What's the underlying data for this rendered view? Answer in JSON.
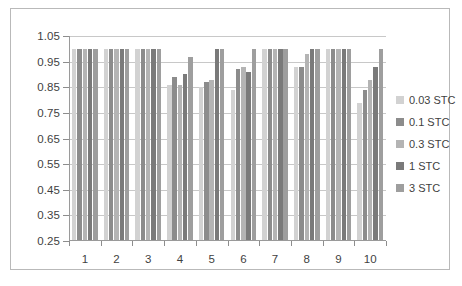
{
  "chart_data": {
    "type": "bar",
    "title": "",
    "xlabel": "",
    "ylabel": "",
    "ylim": [
      0.25,
      1.05
    ],
    "ytick_step": 0.1,
    "ytick_labels": [
      "1.05",
      "0.95",
      "0.85",
      "0.75",
      "0.65",
      "0.55",
      "0.45",
      "0.35",
      "0.25"
    ],
    "ytick_values": [
      1.05,
      0.95,
      0.85,
      0.75,
      0.65,
      0.55,
      0.45,
      0.35,
      0.25
    ],
    "grid": true,
    "legend_position": "right",
    "categories": [
      "1",
      "2",
      "3",
      "4",
      "5",
      "6",
      "7",
      "8",
      "9",
      "10"
    ],
    "series": [
      {
        "name": "0.03 STC",
        "color": "#d2d2d2",
        "values": [
          1.0,
          1.0,
          1.0,
          0.86,
          0.85,
          0.84,
          1.0,
          0.93,
          1.0,
          0.79
        ]
      },
      {
        "name": "0.1 STC",
        "color": "#8c8c8c",
        "values": [
          1.0,
          1.0,
          1.0,
          0.89,
          0.87,
          0.92,
          1.0,
          0.93,
          1.0,
          0.84
        ]
      },
      {
        "name": "0.3 STC",
        "color": "#b4b4b4",
        "values": [
          1.0,
          1.0,
          1.0,
          0.86,
          0.88,
          0.93,
          1.0,
          0.98,
          1.0,
          0.88
        ]
      },
      {
        "name": "1 STC",
        "color": "#7a7a7a",
        "values": [
          1.0,
          1.0,
          1.0,
          0.9,
          1.0,
          0.91,
          1.0,
          1.0,
          1.0,
          0.93
        ]
      },
      {
        "name": "3 STC",
        "color": "#9e9e9e",
        "values": [
          1.0,
          1.0,
          1.0,
          0.97,
          1.0,
          1.0,
          1.0,
          1.0,
          1.0,
          1.0
        ]
      }
    ]
  },
  "legend": {
    "items": [
      {
        "label": "0.03 STC"
      },
      {
        "label": "0.1 STC"
      },
      {
        "label": "0.3 STC"
      },
      {
        "label": "1 STC"
      },
      {
        "label": "3 STC"
      }
    ]
  }
}
